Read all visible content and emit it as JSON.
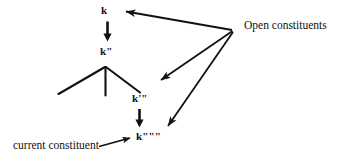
{
  "figure": {
    "type": "linguistic-tree-diagram",
    "background_color": "#ffffff",
    "ink_color": "#111111",
    "width": 343,
    "height": 161
  },
  "nodes": {
    "k": "k",
    "k_double_prime": "k\"",
    "k_triple_prime": "k'\"",
    "k_quad_prime": "k\"\"\""
  },
  "annotations": {
    "open_constituents": "Open constituents",
    "current_constituent": "current constituent"
  },
  "connectors": {
    "k_to_k2": "downward-arrow",
    "k3_to_k4": "downward-arrow",
    "open_to_k": "pointer-arrow",
    "open_to_k3": "pointer-arrow",
    "open_to_k4": "pointer-arrow",
    "current_to_k4": "pointer-arrow"
  },
  "tree": {
    "apex": "k\" expansion node",
    "branches": [
      "left-branch",
      "middle-branch",
      "right-branch"
    ]
  }
}
